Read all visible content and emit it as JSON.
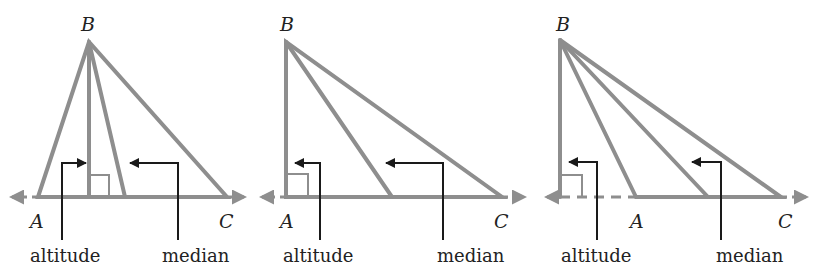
{
  "colors": {
    "line": "#8e8e8e",
    "callout": "#1a1a1a",
    "text": "#222222",
    "background": "#ffffff"
  },
  "baseline_y": 197,
  "panels": [
    {
      "id": "acute",
      "B": {
        "x": 89,
        "y": 42,
        "label": "B",
        "lx": 81,
        "ly": 25
      },
      "A": {
        "x": 38,
        "y": 197,
        "label": "A",
        "lx": 30,
        "ly": 222
      },
      "C": {
        "x": 227,
        "y": 197,
        "label": "C",
        "lx": 219,
        "ly": 222
      },
      "altitude_foot": {
        "x": 89,
        "y": 197
      },
      "median_foot": {
        "x": 125,
        "y": 197
      },
      "right_angle": {
        "x": 89,
        "y": 175,
        "w": 20,
        "h": 22
      },
      "line_left": {
        "x1": 38,
        "x2": 8,
        "dashed_from": null
      },
      "line_right": {
        "x1": 227,
        "x2": 248
      },
      "altitude_callout": {
        "vx": 62,
        "y_bottom": 240,
        "y_top": 163,
        "tip_x": 86
      },
      "median_callout": {
        "vx": 178,
        "y_bottom": 240,
        "y_top": 163,
        "tip_x": 130
      },
      "labels": {
        "altitude": {
          "text": "altitude",
          "x": 30,
          "y": 262
        },
        "median": {
          "text": "median",
          "x": 162,
          "y": 262
        }
      }
    },
    {
      "id": "right",
      "B": {
        "x": 286,
        "y": 42,
        "label": "B",
        "lx": 280,
        "ly": 25
      },
      "A": {
        "x": 286,
        "y": 197,
        "label": "A",
        "lx": 280,
        "ly": 222
      },
      "C": {
        "x": 502,
        "y": 197,
        "label": "C",
        "lx": 494,
        "ly": 222
      },
      "altitude_foot": {
        "x": 286,
        "y": 197
      },
      "median_foot": {
        "x": 392,
        "y": 197
      },
      "right_angle": {
        "x": 286,
        "y": 174,
        "w": 22,
        "h": 23
      },
      "line_left": {
        "x1": 286,
        "x2": 258,
        "dashed_from": null
      },
      "line_right": {
        "x1": 502,
        "x2": 528
      },
      "altitude_callout": {
        "vx": 320,
        "y_bottom": 240,
        "y_top": 163,
        "tip_x": 295
      },
      "median_callout": {
        "vx": 443,
        "y_bottom": 240,
        "y_top": 163,
        "tip_x": 386
      },
      "labels": {
        "altitude": {
          "text": "altitude",
          "x": 283,
          "y": 262
        },
        "median": {
          "text": "median",
          "x": 437,
          "y": 262
        }
      }
    },
    {
      "id": "obtuse",
      "B": {
        "x": 560,
        "y": 40,
        "label": "B",
        "lx": 556,
        "ly": 25
      },
      "A": {
        "x": 636,
        "y": 197,
        "label": "A",
        "lx": 630,
        "ly": 222
      },
      "C": {
        "x": 781,
        "y": 197,
        "label": "C",
        "lx": 778,
        "ly": 222
      },
      "altitude_foot": {
        "x": 560,
        "y": 197
      },
      "median_foot": {
        "x": 708,
        "y": 197
      },
      "right_angle": {
        "x": 560,
        "y": 175,
        "w": 22,
        "h": 22
      },
      "line_left": {
        "x1": 560,
        "x2": 543,
        "dashed_from": 636
      },
      "line_right": {
        "x1": 781,
        "x2": 810
      },
      "altitude_callout": {
        "vx": 597,
        "y_bottom": 240,
        "y_top": 162,
        "tip_x": 569
      },
      "median_callout": {
        "vx": 721,
        "y_bottom": 240,
        "y_top": 162,
        "tip_x": 692
      },
      "labels": {
        "altitude": {
          "text": "altitude",
          "x": 561,
          "y": 262
        },
        "median": {
          "text": "median",
          "x": 716,
          "y": 262
        }
      }
    }
  ]
}
